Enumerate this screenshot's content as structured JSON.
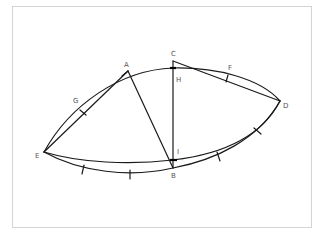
{
  "diagram": {
    "type": "geometric-construction",
    "stroke_color": "#1a1a1a",
    "label_color": "#555555",
    "frame_color": "#d4d4d4",
    "points": {
      "A": {
        "label": "A",
        "x": 128,
        "y": 71
      },
      "B": {
        "label": "B",
        "x": 173,
        "y": 168
      },
      "C": {
        "label": "C",
        "x": 173,
        "y": 61
      },
      "D": {
        "label": "D",
        "x": 280,
        "y": 101
      },
      "E": {
        "label": "E",
        "x": 44,
        "y": 152
      },
      "F": {
        "label": "F",
        "x": 229,
        "y": 72
      },
      "G": {
        "label": "G",
        "x": 77,
        "y": 104
      },
      "H": {
        "label": "H",
        "x": 173,
        "y": 68
      },
      "I": {
        "label": "I",
        "x": 173,
        "y": 160
      }
    },
    "labels": [
      {
        "text": "A",
        "x": 124,
        "y": 67
      },
      {
        "text": "C",
        "x": 171,
        "y": 56
      },
      {
        "text": "H",
        "x": 176,
        "y": 82
      },
      {
        "text": "F",
        "x": 228,
        "y": 70
      },
      {
        "text": "G",
        "x": 73,
        "y": 103
      },
      {
        "text": "D",
        "x": 283,
        "y": 108
      },
      {
        "text": "E",
        "x": 35,
        "y": 158
      },
      {
        "text": "I",
        "x": 177,
        "y": 154
      },
      {
        "text": "B",
        "x": 171,
        "y": 178
      }
    ],
    "segments": [
      "E-A",
      "A-B",
      "C-B",
      "C-D"
    ],
    "arcs": [
      "E-A-H-D upper",
      "E-I-D lower inner",
      "E-B-D lower outer"
    ]
  }
}
